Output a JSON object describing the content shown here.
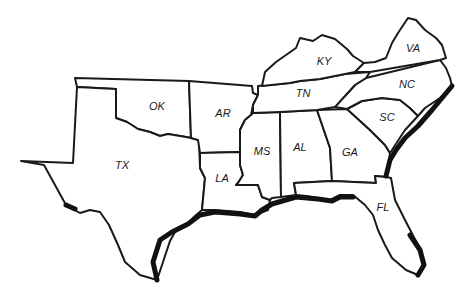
{
  "map": {
    "title": "Southern United States",
    "states": [
      {
        "abbr": "TX",
        "x": 122,
        "y": 165
      },
      {
        "abbr": "OK",
        "x": 157,
        "y": 106
      },
      {
        "abbr": "AR",
        "x": 223,
        "y": 113
      },
      {
        "abbr": "LA",
        "x": 222,
        "y": 178
      },
      {
        "abbr": "MS",
        "x": 262,
        "y": 151
      },
      {
        "abbr": "AL",
        "x": 300,
        "y": 147
      },
      {
        "abbr": "TN",
        "x": 303,
        "y": 93
      },
      {
        "abbr": "KY",
        "x": 324,
        "y": 61
      },
      {
        "abbr": "VA",
        "x": 413,
        "y": 48
      },
      {
        "abbr": "NC",
        "x": 407,
        "y": 84
      },
      {
        "abbr": "SC",
        "x": 387,
        "y": 117
      },
      {
        "abbr": "GA",
        "x": 350,
        "y": 152
      },
      {
        "abbr": "FL",
        "x": 383,
        "y": 207
      }
    ]
  }
}
